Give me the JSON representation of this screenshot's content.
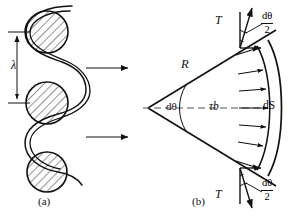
{
  "figure": {
    "panel_a": {
      "caption": "(a)",
      "pitch_label": "λ",
      "rollers": [
        {
          "name": "roller-top",
          "cx": 47,
          "cy": 32,
          "r": 21
        },
        {
          "name": "roller-middle",
          "cx": 47,
          "cy": 103,
          "r": 21
        },
        {
          "name": "roller-bottom",
          "cx": 47,
          "cy": 172,
          "r": 20
        }
      ],
      "motion_arrows": [
        {
          "name": "motion-arrow-upper",
          "x1": 85,
          "y1": 68,
          "x2": 130,
          "y2": 68
        },
        {
          "name": "motion-arrow-lower",
          "x1": 85,
          "y1": 137,
          "x2": 130,
          "y2": 137
        }
      ]
    },
    "panel_b": {
      "caption": "(b)",
      "radius_label": "R",
      "angle_label": "dθ",
      "arc_label": "dS",
      "distributed_load_label": "τb",
      "tension_label_top": "T",
      "tension_label_bottom": "T",
      "half_angle": {
        "numerator": "dθ",
        "denominator": "2"
      },
      "apex": {
        "x": 148,
        "y": 108
      },
      "arrow_count_on_arc": 7
    }
  },
  "colors": {
    "ink": "#111111",
    "paper": "#ffffff",
    "dashed": "#555555"
  }
}
